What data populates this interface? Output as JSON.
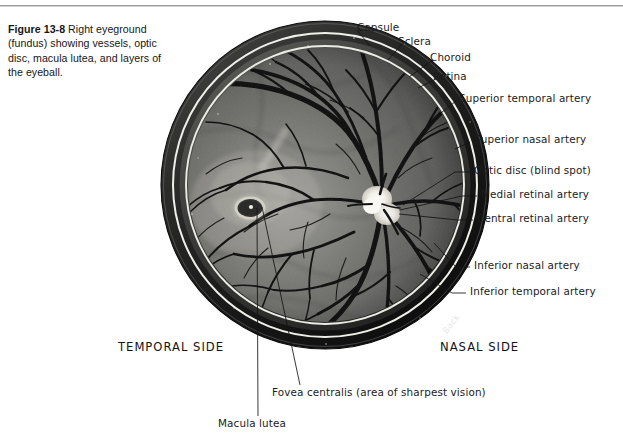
{
  "figure": {
    "number": "Figure 13-8",
    "caption": "Right eyeground (fundus) showing vessels, optic disc, macula lutea, and layers of the eyeball."
  },
  "labels": {
    "capsule": "Capsule",
    "sclera": "Sclera",
    "choroid": "Choroid",
    "retina": "Retina",
    "superior_temporal_artery": "Superior temporal artery",
    "superior_nasal_artery": "Superior nasal artery",
    "optic_disc": "Optic disc (blind spot)",
    "medial_retinal_artery": "Medial retinal artery",
    "central_retinal_artery": "Central retinal artery",
    "inferior_nasal_artery": "Inferior nasal artery",
    "inferior_temporal_artery": "Inferior temporal artery",
    "temporal_side": "TEMPORAL SIDE",
    "nasal_side": "NASAL SIDE",
    "back": "Back",
    "fovea_centralis": "Fovea centralis (area of sharpest vision)",
    "macula_lutea": "Macula lutea"
  },
  "colors": {
    "page_background": "#ffffff",
    "text": "#1a1a1a",
    "rule": "#9a9a9a",
    "sclera_band": "#1d1d1d",
    "choroid_band": "#3a3a3a",
    "retina_field": "#6a6a6a",
    "vessel": "#101010",
    "optic_disc": "#f2f0ea",
    "macula": "#2a2a2a",
    "leader_line": "#111111"
  }
}
